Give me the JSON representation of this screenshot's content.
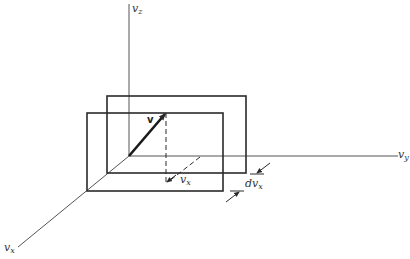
{
  "figure": {
    "colors": {
      "stroke": "#2a2a2a",
      "axis": "#555555",
      "background": "#ffffff"
    },
    "axes": {
      "vz": {
        "base": "v",
        "sub": "z"
      },
      "vy": {
        "base": "v",
        "sub": "y"
      },
      "vx": {
        "base": "v",
        "sub": "x"
      }
    },
    "vector_label": "v",
    "component_label": {
      "base": "v",
      "sub": "x"
    },
    "slab_thickness_label": {
      "base": "dv",
      "sub": "x"
    }
  }
}
